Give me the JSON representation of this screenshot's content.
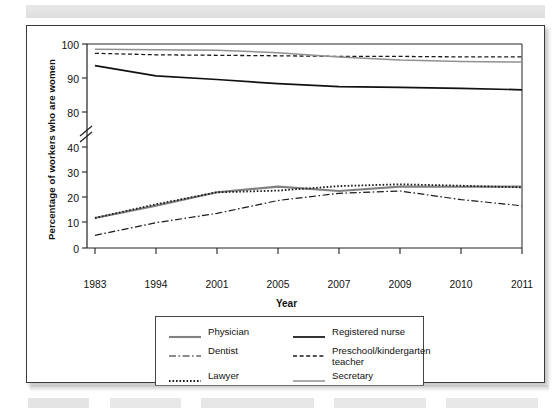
{
  "chart_data": {
    "type": "line",
    "title": "",
    "xlabel": "Year",
    "ylabel": "Percentage of workers who are women",
    "x": [
      "1983",
      "1994",
      "2001",
      "2005",
      "2007",
      "2009",
      "2010",
      "2011"
    ],
    "categories": [
      "1983",
      "1994",
      "2001",
      "2005",
      "2007",
      "2009",
      "2010",
      "2011"
    ],
    "ylim": [
      0,
      100
    ],
    "yticks": [
      "0",
      "10",
      "20",
      "30",
      "40",
      "80",
      "90",
      "100"
    ],
    "axis_break": "between 40 and 80",
    "grid": false,
    "legend_position": "below plot",
    "series": [
      {
        "name": "Physician",
        "style": "solid-gray-thick",
        "color": "#808080",
        "values": [
          15.8,
          22.3,
          29.3,
          32.3,
          30.0,
          32.3,
          32.2,
          32.3
        ]
      },
      {
        "name": "Dentist",
        "style": "dash-dot",
        "color": "#1a1a1a",
        "values": [
          6.7,
          13.3,
          18.2,
          25.0,
          28.8,
          30.0,
          25.5,
          22.2
        ]
      },
      {
        "name": "Lawyer",
        "style": "dotted",
        "color": "#1a1a1a",
        "values": [
          15.8,
          23.0,
          29.3,
          30.2,
          32.6,
          33.5,
          32.8,
          31.9
        ]
      },
      {
        "name": "Registered nurse",
        "style": "solid-black-thick",
        "color": "#111111",
        "values": [
          95.8,
          93.8,
          93.1,
          92.3,
          91.7,
          91.6,
          91.4,
          91.1
        ]
      },
      {
        "name": "Preschool/kindergarten\nteacher",
        "style": "dashed",
        "color": "#1a1a1a",
        "values": [
          98.2,
          97.9,
          97.8,
          97.7,
          97.6,
          97.6,
          97.5,
          97.5
        ]
      },
      {
        "name": "Secretary",
        "style": "solid-gray-thin",
        "color": "#909090",
        "values": [
          99.0,
          98.9,
          98.8,
          98.3,
          97.5,
          96.9,
          96.6,
          96.5
        ]
      }
    ]
  },
  "legend": {
    "items": [
      {
        "label": "Physician",
        "key": "solid-gray-thick"
      },
      {
        "label": "Registered nurse",
        "key": "solid-black-thick"
      },
      {
        "label": "Dentist",
        "key": "dash-dot"
      },
      {
        "label": "Preschool/kindergarten\nteacher",
        "key": "dashed"
      },
      {
        "label": "Lawyer",
        "key": "dotted"
      },
      {
        "label": "Secretary",
        "key": "solid-gray-thin"
      }
    ]
  }
}
